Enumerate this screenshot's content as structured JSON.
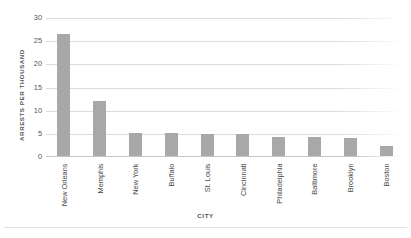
{
  "chart_data": {
    "type": "bar",
    "title": "",
    "xlabel": "CITY",
    "ylabel": "ARRESTS PER THOUSAND",
    "categories": [
      "New Orleans",
      "Memphis",
      "New York",
      "Buffalo",
      "St. Louis",
      "Cincinnati",
      "Philadelphia",
      "Baltimore",
      "Brooklyn",
      "Boston"
    ],
    "values": [
      26.5,
      12,
      5.2,
      5.2,
      5,
      5,
      4.4,
      4.4,
      4.2,
      2.4
    ],
    "ylim": [
      0,
      30
    ],
    "yticks": [
      0,
      5,
      10,
      15,
      20,
      25,
      30
    ],
    "ytick_labels": [
      "0",
      "5",
      "10",
      "15",
      "20",
      "25",
      "30"
    ],
    "grid": true,
    "legend": "none",
    "bar_color": "#a8a8a8",
    "gridline_color": "#dcdcdc",
    "axis_text_color": "#555555"
  }
}
